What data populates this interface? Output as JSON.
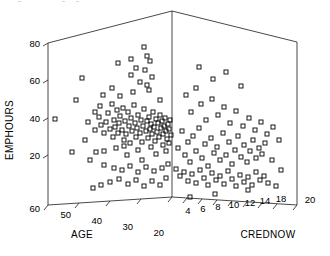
{
  "chart_data": {
    "type": "scatter",
    "projection": "3d",
    "title": "",
    "xlabel": "AGE",
    "ylabel": "CREDNOW",
    "zlabel": "EMPHOURS",
    "axes": {
      "age": {
        "label": "AGE",
        "ticks": [
          60,
          50,
          40,
          30,
          20
        ],
        "tick_labels": [
          "60",
          "50",
          "40",
          "30",
          "20"
        ],
        "min": 20,
        "max": 60,
        "direction": "descending-left-to-right"
      },
      "crednow": {
        "label": "CREDNOW",
        "ticks": [
          4,
          6,
          8,
          10,
          12,
          14,
          16,
          18,
          20
        ],
        "tick_labels": [
          "4",
          "6",
          "8",
          "10",
          "12",
          "14",
          "",
          "18",
          "20"
        ],
        "min": 2,
        "max": 20,
        "direction": "ascending-left-to-right"
      },
      "emphours": {
        "label": "EMPHOURS",
        "ticks": [
          20,
          40,
          60,
          80
        ],
        "tick_labels": [
          "20",
          "40",
          "60",
          "80"
        ],
        "min": 0,
        "max": 80
      }
    },
    "grid": false,
    "legend": null,
    "marker": {
      "shape": "open-square",
      "size": 4,
      "color": "#000000",
      "fill": "none"
    },
    "n_points": 186,
    "note": "Left half of cloud = AGE axis (older at left), right half = CREDNOW axis; vertical = EMPHOURS.",
    "points_px": [
      [
        55,
        119
      ],
      [
        76,
        100
      ],
      [
        88,
        122
      ],
      [
        95,
        112
      ],
      [
        95,
        130
      ],
      [
        99,
        117
      ],
      [
        100,
        106
      ],
      [
        101,
        125
      ],
      [
        103,
        95
      ],
      [
        104,
        133
      ],
      [
        106,
        122
      ],
      [
        108,
        113
      ],
      [
        110,
        129
      ],
      [
        112,
        104
      ],
      [
        113,
        137
      ],
      [
        114,
        120
      ],
      [
        115,
        127
      ],
      [
        117,
        110
      ],
      [
        118,
        133
      ],
      [
        119,
        123
      ],
      [
        120,
        116
      ],
      [
        122,
        130
      ],
      [
        123,
        108
      ],
      [
        124,
        140
      ],
      [
        125,
        121
      ],
      [
        126,
        134
      ],
      [
        128,
        112
      ],
      [
        129,
        126
      ],
      [
        130,
        143
      ],
      [
        131,
        118
      ],
      [
        132,
        131
      ],
      [
        134,
        105
      ],
      [
        135,
        123
      ],
      [
        136,
        137
      ],
      [
        137,
        128
      ],
      [
        138,
        115
      ],
      [
        140,
        133
      ],
      [
        141,
        120
      ],
      [
        142,
        142
      ],
      [
        143,
        126
      ],
      [
        144,
        109
      ],
      [
        146,
        131
      ],
      [
        147,
        121
      ],
      [
        148,
        138
      ],
      [
        149,
        117
      ],
      [
        150,
        129
      ],
      [
        151,
        124
      ],
      [
        152,
        134
      ],
      [
        153,
        112
      ],
      [
        154,
        127
      ],
      [
        155,
        141
      ],
      [
        156,
        119
      ],
      [
        157,
        132
      ],
      [
        158,
        123
      ],
      [
        159,
        137
      ],
      [
        160,
        115
      ],
      [
        161,
        128
      ],
      [
        162,
        121
      ],
      [
        163,
        134
      ],
      [
        164,
        126
      ],
      [
        165,
        118
      ],
      [
        166,
        131
      ],
      [
        167,
        139
      ],
      [
        168,
        124
      ],
      [
        169,
        129
      ],
      [
        170,
        120
      ],
      [
        171,
        135
      ],
      [
        72,
        152
      ],
      [
        82,
        78
      ],
      [
        85,
        140
      ],
      [
        90,
        160
      ],
      [
        96,
        152
      ],
      [
        104,
        151
      ],
      [
        112,
        88
      ],
      [
        116,
        148
      ],
      [
        120,
        96
      ],
      [
        124,
        146
      ],
      [
        127,
        155
      ],
      [
        133,
        92
      ],
      [
        138,
        150
      ],
      [
        142,
        160
      ],
      [
        147,
        85
      ],
      [
        151,
        147
      ],
      [
        156,
        154
      ],
      [
        160,
        100
      ],
      [
        163,
        145
      ],
      [
        166,
        151
      ],
      [
        169,
        143
      ],
      [
        118,
        63
      ],
      [
        131,
        75
      ],
      [
        136,
        68
      ],
      [
        140,
        82
      ],
      [
        145,
        70
      ],
      [
        149,
        90
      ],
      [
        152,
        77
      ],
      [
        131,
        59
      ],
      [
        147,
        56
      ],
      [
        150,
        61
      ],
      [
        144,
        47
      ],
      [
        104,
        165
      ],
      [
        114,
        168
      ],
      [
        122,
        170
      ],
      [
        130,
        166
      ],
      [
        138,
        172
      ],
      [
        146,
        167
      ],
      [
        154,
        171
      ],
      [
        162,
        168
      ],
      [
        168,
        164
      ],
      [
        110,
        182
      ],
      [
        119,
        179
      ],
      [
        128,
        184
      ],
      [
        136,
        180
      ],
      [
        144,
        186
      ],
      [
        152,
        181
      ],
      [
        160,
        185
      ],
      [
        166,
        178
      ],
      [
        93,
        188
      ],
      [
        101,
        185
      ],
      [
        178,
        148
      ],
      [
        182,
        131
      ],
      [
        185,
        155
      ],
      [
        188,
        142
      ],
      [
        190,
        162
      ],
      [
        193,
        136
      ],
      [
        196,
        151
      ],
      [
        199,
        128
      ],
      [
        202,
        158
      ],
      [
        205,
        144
      ],
      [
        208,
        166
      ],
      [
        211,
        138
      ],
      [
        214,
        153
      ],
      [
        217,
        147
      ],
      [
        220,
        160
      ],
      [
        223,
        133
      ],
      [
        226,
        155
      ],
      [
        229,
        142
      ],
      [
        232,
        164
      ],
      [
        235,
        150
      ],
      [
        238,
        136
      ],
      [
        241,
        157
      ],
      [
        244,
        145
      ],
      [
        247,
        162
      ],
      [
        250,
        151
      ],
      [
        253,
        140
      ],
      [
        256,
        158
      ],
      [
        259,
        148
      ],
      [
        262,
        154
      ],
      [
        265,
        143
      ],
      [
        176,
        169
      ],
      [
        180,
        176
      ],
      [
        184,
        172
      ],
      [
        188,
        181
      ],
      [
        192,
        174
      ],
      [
        196,
        183
      ],
      [
        200,
        170
      ],
      [
        204,
        178
      ],
      [
        208,
        185
      ],
      [
        212,
        173
      ],
      [
        216,
        180
      ],
      [
        220,
        176
      ],
      [
        224,
        184
      ],
      [
        228,
        171
      ],
      [
        232,
        179
      ],
      [
        236,
        186
      ],
      [
        240,
        175
      ],
      [
        244,
        182
      ],
      [
        248,
        177
      ],
      [
        252,
        185
      ],
      [
        256,
        172
      ],
      [
        260,
        180
      ],
      [
        264,
        176
      ],
      [
        268,
        183
      ],
      [
        186,
        95
      ],
      [
        191,
        112
      ],
      [
        196,
        88
      ],
      [
        201,
        104
      ],
      [
        206,
        120
      ],
      [
        212,
        99
      ],
      [
        218,
        115
      ],
      [
        224,
        107
      ],
      [
        230,
        123
      ],
      [
        236,
        111
      ],
      [
        243,
        126
      ],
      [
        249,
        118
      ],
      [
        255,
        130
      ],
      [
        261,
        122
      ],
      [
        267,
        134
      ],
      [
        273,
        127
      ],
      [
        279,
        140
      ],
      [
        199,
        67
      ],
      [
        213,
        79
      ],
      [
        226,
        72
      ],
      [
        241,
        86
      ],
      [
        190,
        197
      ],
      [
        215,
        194
      ],
      [
        248,
        190
      ],
      [
        272,
        160
      ],
      [
        281,
        170
      ],
      [
        276,
        186
      ]
    ]
  },
  "geometry": {
    "apex": [
      172,
      11
    ],
    "left_top": [
      48,
      43
    ],
    "right_top": [
      297,
      42
    ],
    "front_bottom": [
      172,
      197
    ],
    "left_bottom": [
      48,
      205
    ],
    "right_bottom": [
      297,
      205
    ]
  }
}
